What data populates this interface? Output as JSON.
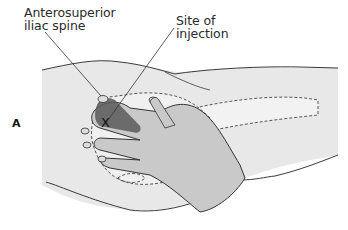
{
  "figure": {
    "panel_label": "A",
    "labels": {
      "anterosuperior_iliac_spine_line1": "Anterosuperior",
      "anterosuperior_iliac_spine_line2": "iliac spine",
      "site_of_injection_line1": "Site of",
      "site_of_injection_line2": "injection"
    },
    "marker": "X",
    "colors": {
      "skin": "#e6e6e6",
      "hand": "#c8c8c8",
      "muscle": "#5a5a5a",
      "outline": "#3a3a3a",
      "text": "#2a2a2a"
    }
  }
}
